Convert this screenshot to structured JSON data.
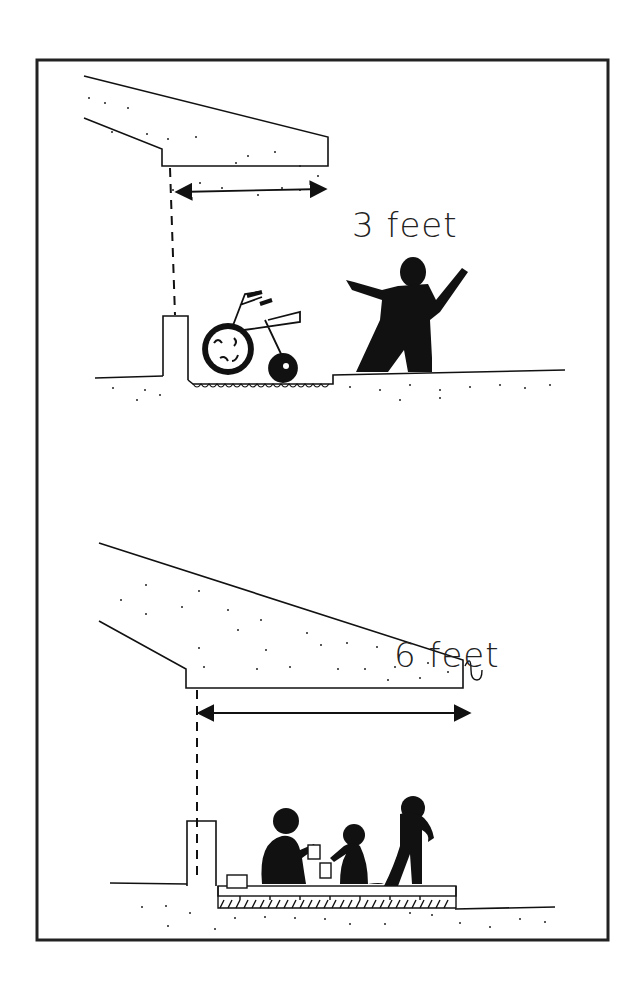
{
  "illustration": {
    "description": "Hand-drawn comparison of roof overhang depths",
    "colors": {
      "ink": "#111111",
      "paper": "#ffffff"
    },
    "panels": [
      {
        "id": "shallow",
        "label": "3 feet",
        "overhang_feet": 3,
        "scene": [
          "roof-overhang",
          "post-dashed-line",
          "dimension-arrow",
          "tricycle",
          "child-arms-raised",
          "ground"
        ]
      },
      {
        "id": "deep",
        "label": "6 feet",
        "overhang_feet": 6,
        "scene": [
          "roof-overhang",
          "gutter",
          "post-dashed-line",
          "dimension-arrow",
          "children-playing",
          "standing-adult",
          "paved-floor",
          "ground"
        ]
      }
    ]
  }
}
